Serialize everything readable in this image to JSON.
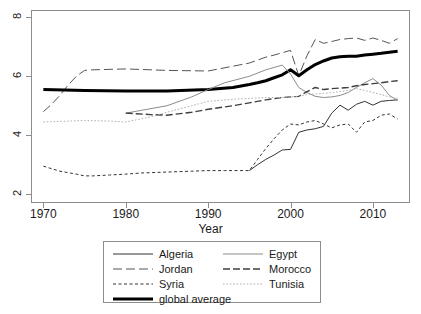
{
  "chart_data": {
    "type": "line",
    "title": "",
    "xlabel": "Year",
    "ylabel": "",
    "xlim": [
      1968.5,
      2014.5
    ],
    "ylim": [
      1.7,
      8.25
    ],
    "grid": false,
    "legend_position": "bottom",
    "x_ticks": [
      1970,
      1980,
      1990,
      2000,
      2010
    ],
    "x_tick_labels": [
      "1970",
      "1980",
      "1990",
      "2000",
      "2010"
    ],
    "y_ticks": [
      2,
      4,
      6,
      8
    ],
    "y_tick_labels": [
      "2",
      "4",
      "6",
      "8"
    ],
    "series": [
      {
        "name": "Algeria",
        "style": "solid",
        "width": 1,
        "color": "#333333",
        "x": [
          1995,
          1996,
          1997,
          1998,
          1999,
          2000,
          2001,
          2002,
          2003,
          2004,
          2005,
          2006,
          2007,
          2008,
          2009,
          2010,
          2011,
          2012,
          2013
        ],
        "values": [
          2.8,
          3.0,
          3.18,
          3.33,
          3.5,
          3.52,
          4.1,
          4.18,
          4.22,
          4.3,
          4.75,
          5.02,
          4.85,
          5.05,
          5.15,
          5.02,
          5.15,
          5.18,
          5.2
        ]
      },
      {
        "name": "Jordan",
        "style": "longdash",
        "width": 1,
        "color": "#555555",
        "x": [
          1970,
          1971,
          1972,
          1973,
          1974,
          1975,
          1976,
          1980,
          1985,
          1990,
          1995,
          1996,
          1997,
          1998,
          1999,
          2000,
          2001,
          2002,
          2003,
          2004,
          2005,
          2006,
          2007,
          2008,
          2009,
          2010,
          2011,
          2012,
          2013
        ],
        "values": [
          4.8,
          5.05,
          5.35,
          5.7,
          6.0,
          6.2,
          6.22,
          6.25,
          6.2,
          6.18,
          6.45,
          6.55,
          6.65,
          6.72,
          6.8,
          6.88,
          6.02,
          6.7,
          7.25,
          7.12,
          7.18,
          7.25,
          7.28,
          7.3,
          7.22,
          7.3,
          7.22,
          7.12,
          7.28
        ]
      },
      {
        "name": "Syria",
        "style": "shortdash",
        "width": 1,
        "color": "#333333",
        "x": [
          1970,
          1972,
          1974,
          1975,
          1976,
          1978,
          1980,
          1982,
          1985,
          1988,
          1990,
          1992,
          1995,
          1996,
          1997,
          1998,
          1999,
          2000,
          2001,
          2002,
          2003,
          2004,
          2005,
          2006,
          2007,
          2008,
          2009,
          2010,
          2011,
          2012,
          2013
        ],
        "values": [
          2.95,
          2.78,
          2.68,
          2.62,
          2.62,
          2.65,
          2.68,
          2.72,
          2.75,
          2.78,
          2.8,
          2.8,
          2.8,
          3.18,
          3.55,
          3.88,
          4.18,
          4.38,
          4.35,
          4.45,
          4.5,
          4.38,
          4.25,
          4.35,
          4.38,
          4.1,
          4.45,
          4.5,
          4.68,
          4.72,
          4.55
        ]
      },
      {
        "name": "global average",
        "style": "solid",
        "width": 3,
        "color": "#000000",
        "x": [
          1970,
          1975,
          1980,
          1985,
          1990,
          1993,
          1995,
          1996,
          1997,
          1998,
          1999,
          2000,
          2001,
          2002,
          2003,
          2004,
          2005,
          2006,
          2007,
          2008,
          2009,
          2010,
          2011,
          2012,
          2013
        ],
        "values": [
          5.55,
          5.52,
          5.5,
          5.5,
          5.55,
          5.62,
          5.72,
          5.78,
          5.85,
          5.95,
          6.05,
          6.22,
          6.02,
          6.22,
          6.4,
          6.52,
          6.62,
          6.66,
          6.68,
          6.68,
          6.72,
          6.75,
          6.78,
          6.82,
          6.85
        ]
      },
      {
        "name": "Egypt",
        "style": "solid",
        "width": 1,
        "color": "#8c8c8c",
        "x": [
          1980,
          1981,
          1982,
          1985,
          1988,
          1990,
          1992,
          1995,
          1997,
          1999,
          2000,
          2001,
          2002,
          2003,
          2004,
          2005,
          2006,
          2007,
          2008,
          2009,
          2010,
          2011,
          2012,
          2013
        ],
        "values": [
          4.75,
          4.8,
          4.85,
          5.0,
          5.3,
          5.55,
          5.78,
          6.0,
          6.22,
          6.38,
          6.08,
          5.62,
          5.45,
          5.32,
          5.28,
          5.3,
          5.35,
          5.45,
          5.62,
          5.78,
          5.92,
          5.7,
          5.35,
          5.18
        ]
      },
      {
        "name": "Morocco",
        "style": "dashdash",
        "width": 1.4,
        "color": "#3f3f3f",
        "x": [
          1980,
          1983,
          1985,
          1988,
          1990,
          1993,
          1995,
          1997,
          1999,
          2000,
          2001,
          2002,
          2003,
          2004,
          2005,
          2006,
          2007,
          2008,
          2009,
          2010,
          2011,
          2012,
          2013
        ],
        "values": [
          4.75,
          4.7,
          4.68,
          4.78,
          4.88,
          5.0,
          5.1,
          5.2,
          5.28,
          5.3,
          5.32,
          5.48,
          5.62,
          5.55,
          5.58,
          5.6,
          5.62,
          5.68,
          5.72,
          5.75,
          5.78,
          5.82,
          5.85
        ]
      },
      {
        "name": "Tunisia",
        "style": "dotted",
        "width": 1,
        "color": "#b0b0b0",
        "x": [
          1970,
          1975,
          1978,
          1980,
          1983,
          1985,
          1988,
          1990,
          1993,
          1995,
          1997,
          1999,
          2000,
          2001,
          2002,
          2003,
          2004,
          2005,
          2006,
          2007,
          2008,
          2009,
          2010,
          2011,
          2012,
          2013
        ],
        "values": [
          4.45,
          4.5,
          4.48,
          4.45,
          4.62,
          4.78,
          5.0,
          5.15,
          5.22,
          5.25,
          5.28,
          5.28,
          5.3,
          5.32,
          5.38,
          5.4,
          5.42,
          5.45,
          5.48,
          5.52,
          5.58,
          5.52,
          5.45,
          5.38,
          5.3,
          5.25
        ]
      }
    ]
  },
  "axes": {
    "x_title": "Year"
  },
  "legend": {
    "entries": [
      {
        "label": "Algeria",
        "key": "Algeria"
      },
      {
        "label": "Egypt",
        "key": "Egypt"
      },
      {
        "label": "Jordan",
        "key": "Jordan"
      },
      {
        "label": "Morocco",
        "key": "Morocco"
      },
      {
        "label": "Syria",
        "key": "Syria"
      },
      {
        "label": "Tunisia",
        "key": "Tunisia"
      },
      {
        "label": "global average",
        "key": "global average"
      }
    ]
  }
}
